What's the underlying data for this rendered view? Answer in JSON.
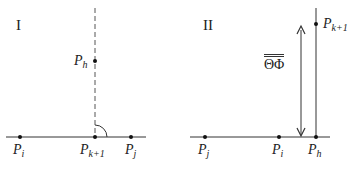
{
  "panels": [
    {
      "id": "I",
      "label": "I",
      "points": [
        {
          "name": "P",
          "sub": "i",
          "x": 20,
          "y": 137
        },
        {
          "name": "P",
          "sub": "k+1",
          "x": 95,
          "y": 137
        },
        {
          "name": "P",
          "sub": "j",
          "x": 131,
          "y": 137
        },
        {
          "name": "P",
          "sub": "h",
          "x": 95,
          "y": 61
        }
      ],
      "notes": "dashed vertical through P_k+1; right-angle arc at P_k+1"
    },
    {
      "id": "II",
      "label": "II",
      "points": [
        {
          "name": "P",
          "sub": "j",
          "x": 205,
          "y": 137
        },
        {
          "name": "P",
          "sub": "i",
          "x": 279,
          "y": 137
        },
        {
          "name": "P",
          "sub": "h",
          "x": 316,
          "y": 137
        },
        {
          "name": "P",
          "sub": "k+1",
          "x": 316,
          "y": 24
        }
      ],
      "measure_label": "ΘΦ",
      "notes": "double-headed arrow indicating distance; solid vertical line through P_h"
    }
  ],
  "labels": {
    "panel1_title": "I",
    "panel2_title": "II",
    "p1_pi_base": "P",
    "p1_pi_sub": "i",
    "p1_pk1_base": "P",
    "p1_pk1_sub": "k+1",
    "p1_pj_base": "P",
    "p1_pj_sub": "j",
    "p1_ph_base": "P",
    "p1_ph_sub": "h",
    "p2_pj_base": "P",
    "p2_pj_sub": "j",
    "p2_pi_base": "P",
    "p2_pi_sub": "i",
    "p2_ph_base": "P",
    "p2_ph_sub": "h",
    "p2_pk1_base": "P",
    "p2_pk1_sub": "k+1",
    "measure": "ΘΦ"
  }
}
